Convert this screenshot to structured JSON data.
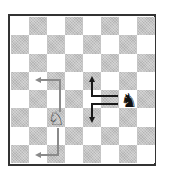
{
  "diagram": {
    "type": "chess-board",
    "size": 8,
    "top_left_square": "light",
    "colors": {
      "light": "#ffffff",
      "dark": "#c4c4c4",
      "border": "#333333",
      "gray_arrow": "#8a8a8a",
      "black_arrow": "#1a1a1a"
    },
    "pieces": [
      {
        "name": "black-knight",
        "glyph": "♞",
        "square": "g4",
        "color": "black"
      },
      {
        "name": "white-knight",
        "glyph": "♘",
        "square": "c3",
        "color": "white"
      }
    ],
    "arrows": [
      {
        "name": "black-knight-path-up",
        "color": "black",
        "from": "g4",
        "via": "e4",
        "to": "e5"
      },
      {
        "name": "black-knight-path-down",
        "color": "black",
        "from": "g4",
        "via": "e4",
        "to": "e3"
      },
      {
        "name": "white-knight-path-up",
        "color": "gray",
        "from": "c3",
        "via": "c5",
        "to": "b5"
      },
      {
        "name": "white-knight-path-down",
        "color": "gray",
        "from": "c3",
        "via": "c1",
        "to": "b1"
      }
    ]
  }
}
